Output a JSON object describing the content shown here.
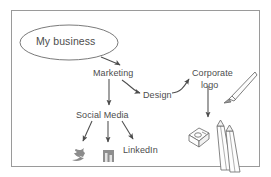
{
  "diagram": {
    "frame_color": "#9a9a9a",
    "ink_color": "#4d4d4d",
    "background": "#ffffff",
    "nodes": {
      "root": "My business",
      "marketing": "Marketing",
      "design": "Design",
      "corporate_logo_line1": "Corporate",
      "corporate_logo_line2": "logo",
      "social_media": "Social Media",
      "linkedin": "LinkedIn"
    },
    "icons": [
      {
        "name": "twitter-bird-icon",
        "label": "Twitter"
      },
      {
        "name": "facebook-square-icon",
        "label": "Facebook"
      },
      {
        "name": "paint-brush-icon",
        "label": "Brush"
      },
      {
        "name": "pencil-sharpener-icon",
        "label": "Sharpener"
      },
      {
        "name": "pencils-icon",
        "label": "Pencils"
      }
    ],
    "edges": [
      {
        "from": "My business",
        "to": "Marketing"
      },
      {
        "from": "Marketing",
        "to": "Design"
      },
      {
        "from": "Marketing",
        "to": "Social Media"
      },
      {
        "from": "Design",
        "to": "Corporate logo"
      },
      {
        "from": "Corporate logo",
        "to": "Sharpener and pencils"
      },
      {
        "from": "Social Media",
        "to": "Twitter"
      },
      {
        "from": "Social Media",
        "to": "Facebook"
      },
      {
        "from": "Social Media",
        "to": "LinkedIn"
      }
    ]
  }
}
